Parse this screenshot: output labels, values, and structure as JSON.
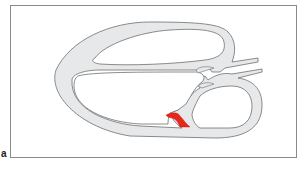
{
  "figure": {
    "panel_label": "a",
    "colors": {
      "frame": "#8a8a8a",
      "vessel_fill": "#e6e8ea",
      "vessel_stroke": "#6f6f6f",
      "highlight": "#e8261a",
      "background": "#ffffff"
    }
  }
}
